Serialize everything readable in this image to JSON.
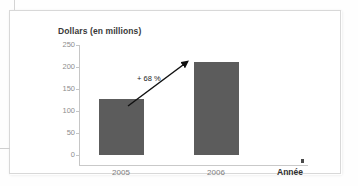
{
  "chart_data": {
    "type": "bar",
    "title": "Dollars (en millions)",
    "xlabel": "Année",
    "ylabel": "",
    "categories": [
      "2005",
      "2006"
    ],
    "values": [
      127,
      212
    ],
    "ylim": [
      0,
      250
    ],
    "yticks": [
      "0",
      "50",
      "100",
      "150",
      "200",
      "250"
    ],
    "grid": false,
    "legend": "none",
    "annotations": [
      {
        "text": "+ 68 %",
        "kind": "growth-arrow",
        "from_category": "2005",
        "to_category": "2006"
      }
    ],
    "series": [
      {
        "name": "Dollars (en millions)",
        "values": [
          127,
          212
        ],
        "color": "#5c5c5c"
      }
    ]
  },
  "chart": {
    "title": "Dollars (en millions)",
    "x_axis_label": "Année",
    "bar_color": "#5c5c5c",
    "axis_color": "#c6c6c6",
    "tick_label_color": "#8d8d8d",
    "annotation_label": "+ 68 %",
    "y_ticks": [
      {
        "label": "250",
        "value": 250
      },
      {
        "label": "200",
        "value": 200
      },
      {
        "label": "150",
        "value": 150
      },
      {
        "label": "100",
        "value": 100
      },
      {
        "label": "50",
        "value": 50
      },
      {
        "label": "0",
        "value": 0
      }
    ],
    "bars": [
      {
        "label": "2005",
        "value": 127
      },
      {
        "label": "2006",
        "value": 212
      }
    ]
  }
}
